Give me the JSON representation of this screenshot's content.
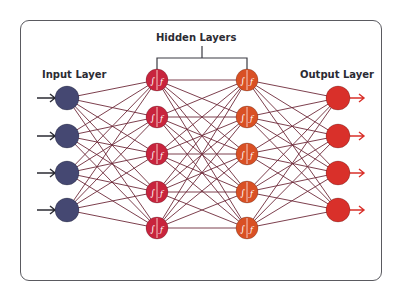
{
  "diagram": {
    "labels": {
      "input": "Input  Layer",
      "hidden": "Hidden Layers",
      "output": "Output  Layer"
    },
    "colors": {
      "input_node": "#454872",
      "hidden1_node": "#c8243d",
      "hidden2_node": "#d95024",
      "output_node": "#d9302a",
      "edge": "#6e2a3a",
      "frame": "#5a5a60",
      "text": "#2b2b33"
    },
    "layers": [
      {
        "name": "input",
        "x": 67,
        "nodes_y": [
          98,
          136,
          173,
          210
        ],
        "radius": 12,
        "color_key": "input_node",
        "glyph": ""
      },
      {
        "name": "hidden-1",
        "x": 157,
        "nodes_y": [
          80,
          117,
          154,
          192,
          228
        ],
        "radius": 11,
        "color_key": "hidden1_node",
        "glyph": "∫ ƒ"
      },
      {
        "name": "hidden-2",
        "x": 247,
        "nodes_y": [
          80,
          117,
          154,
          192,
          228
        ],
        "radius": 11,
        "color_key": "hidden2_node",
        "glyph": "∫ ƒ"
      },
      {
        "name": "output",
        "x": 338,
        "nodes_y": [
          98,
          136,
          173,
          210
        ],
        "radius": 12,
        "color_key": "output_node",
        "glyph": ""
      }
    ],
    "node_symbols": [
      "summation-icon",
      "activation-function-icon"
    ],
    "connections": "fully-connected"
  }
}
